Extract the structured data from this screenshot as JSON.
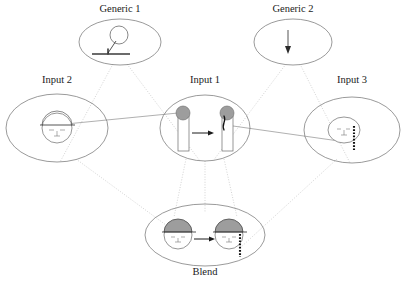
{
  "diagram": {
    "type": "conceptual-blending-network",
    "title": "",
    "canvas": {
      "width": 403,
      "height": 284
    },
    "spaces": [
      {
        "id": "generic1",
        "label": "Generic 1",
        "role": "generic-space",
        "label_x": 120,
        "label_y": 12,
        "cx": 120,
        "cy": 42,
        "rx": 41,
        "ry": 23,
        "content_description": "ball on a stick standing on a ground line"
      },
      {
        "id": "generic2",
        "label": "Generic 2",
        "role": "generic-space",
        "label_x": 293,
        "label_y": 12,
        "cx": 293,
        "cy": 42,
        "rx": 39,
        "ry": 23,
        "content_description": "downward arrow"
      },
      {
        "id": "input2",
        "label": "Input 2",
        "role": "input-space",
        "label_x": 57,
        "label_y": 83,
        "cx": 57,
        "cy": 128,
        "rx": 51,
        "ry": 34,
        "content_description": "face with domed cap and horizontal brim"
      },
      {
        "id": "input1",
        "label": "Input 1",
        "role": "input-space",
        "label_x": 205,
        "label_y": 83,
        "cx": 205,
        "cy": 128,
        "rx": 45,
        "ry": 33,
        "content_description": "two posts with gray balls on top, arrow between, right post cracked"
      },
      {
        "id": "input3",
        "label": "Input 3",
        "role": "input-space",
        "label_x": 352,
        "label_y": 83,
        "cx": 352,
        "cy": 130,
        "rx": 48,
        "ry": 33,
        "content_description": "small face with vertical dotted stream"
      },
      {
        "id": "blend",
        "label": "Blend",
        "role": "blended-space",
        "label_x": 205,
        "label_y": 275,
        "cx": 205,
        "cy": 235,
        "rx": 60,
        "ry": 31,
        "content_description": "two capped faces, arrow between, right face with dotted stream"
      }
    ],
    "projections": [
      {
        "from": "generic1",
        "to": "input2",
        "style": "dotted"
      },
      {
        "from": "generic1",
        "to": "input1",
        "style": "dotted"
      },
      {
        "from": "generic2",
        "to": "input1",
        "style": "dotted"
      },
      {
        "from": "generic2",
        "to": "input3",
        "style": "dotted"
      },
      {
        "from": "input2",
        "to": "blend",
        "style": "dotted"
      },
      {
        "from": "input1",
        "to": "blend",
        "style": "dotted"
      },
      {
        "from": "input3",
        "to": "blend",
        "style": "dotted"
      }
    ],
    "cross_space_links": [
      {
        "from": "input2",
        "to": "input1",
        "style": "solid-thin"
      },
      {
        "from": "input1",
        "to": "input3",
        "style": "solid-thin"
      }
    ],
    "colors": {
      "ellipse_stroke": "#6e6e6e",
      "projection_line": "#b5b5b5",
      "cross_line": "#7a7a7a",
      "gray_fill": "#9d9d9d",
      "ink": "#1a1a1a",
      "background": "#ffffff"
    }
  }
}
